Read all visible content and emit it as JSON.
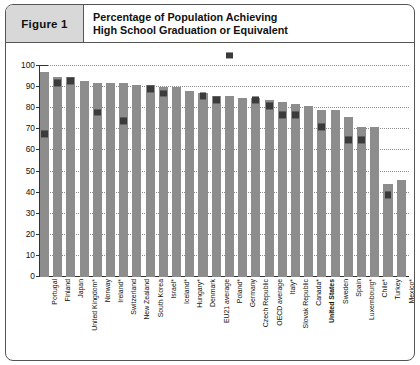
{
  "figure": {
    "number_label": "Figure 1",
    "title_line1": "Percentage of Population Achieving",
    "title_line2": "High School Graduation or Equivalent"
  },
  "colors": {
    "bar": "#8d8d8d",
    "marker": "#3b3b3b",
    "header_cell": "#d8d8d8",
    "border": "#555555",
    "gridline": "#8d8d8d"
  },
  "chart_data": {
    "type": "bar",
    "title": "Percentage of Population Achieving High School Graduation or Equivalent",
    "xlabel": "",
    "ylabel": "",
    "ylim": [
      0,
      100
    ],
    "yticks": [
      0,
      10,
      20,
      30,
      40,
      50,
      60,
      70,
      80,
      90,
      100
    ],
    "grid": true,
    "legend_position": "none",
    "categories": [
      "Portugal",
      "Finland",
      "Japan",
      "United Kingdom*",
      "Norway",
      "Ireland*",
      "Switzerland",
      "New Zealand",
      "South Korea",
      "Israel*",
      "Iceland*",
      "Hungary*",
      "Denmark",
      "EU21 average",
      "Poland*",
      "Germany",
      "Czech Republic",
      "OECD average",
      "Italy*",
      "Slovak Republic",
      "Canada*",
      "United States",
      "Sweden",
      "Spain",
      "Luxembourg*",
      "Chile*",
      "Turkey",
      "Mexico*"
    ],
    "series": [
      {
        "name": "Percentage achieving high school graduation or equivalent",
        "type": "bar",
        "values": [
          97,
          95,
          95,
          93,
          92,
          92,
          92,
          91,
          91,
          90,
          90,
          88,
          87,
          86,
          86,
          85,
          85,
          84,
          83,
          82,
          81,
          79,
          79,
          76,
          71,
          71,
          44,
          46
        ]
      },
      {
        "name": "Marker value",
        "type": "marker",
        "values": [
          68,
          92,
          93,
          null,
          78,
          null,
          74,
          null,
          89,
          87,
          null,
          null,
          86,
          84,
          105,
          null,
          84,
          81,
          77,
          77,
          null,
          71,
          null,
          65,
          65,
          null,
          39,
          null
        ]
      }
    ]
  }
}
